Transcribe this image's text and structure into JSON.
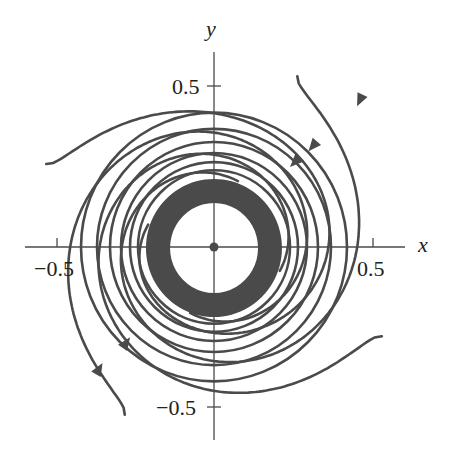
{
  "chart_data": {
    "type": "line",
    "title": "",
    "subtitle": "",
    "xlabel": "x",
    "ylabel": "y",
    "x_ticks": [
      -0.5,
      0.5
    ],
    "y_ticks": [
      0.5,
      -0.5
    ],
    "x_tick_labels": [
      "−0.5",
      "0.5"
    ],
    "y_tick_labels": [
      "0.5",
      "−0.5"
    ],
    "xlim": [
      -0.6,
      0.6
    ],
    "ylim": [
      -0.6,
      0.52
    ],
    "grid": false,
    "legend": null,
    "equilibrium": {
      "x": 0,
      "y": 0
    },
    "limit_cycle": {
      "inner_radius": 0.14,
      "outer_radius": 0.22
    },
    "series": [
      {
        "name": "outer trajectory A",
        "start": [
          -0.58,
          0.62
        ],
        "direction": "clockwise-inward",
        "arrows": [
          [
            0.5,
            0.51
          ]
        ]
      },
      {
        "name": "outer trajectory B",
        "start": [
          0.42,
          0.58
        ],
        "direction": "clockwise-inward",
        "arrows": [
          [
            0.3,
            0.33
          ]
        ]
      },
      {
        "name": "outer trajectory C",
        "start": [
          0.6,
          -0.3
        ],
        "direction": "clockwise-inward",
        "arrows": [
          [
            -0.28,
            -0.3
          ]
        ]
      },
      {
        "name": "outer trajectory D",
        "start": [
          -0.17,
          -0.62
        ],
        "direction": "clockwise-inward",
        "arrows": [
          [
            -0.36,
            -0.39
          ]
        ]
      }
    ],
    "colors": {
      "line": "#4a4a4a",
      "background": "#ffffff"
    }
  },
  "axes": {
    "x_name": "x",
    "y_name": "y",
    "x_tick_neg": "−0.5",
    "x_tick_pos": "0.5",
    "y_tick_pos": "0.5",
    "y_tick_neg": "−0.5"
  }
}
